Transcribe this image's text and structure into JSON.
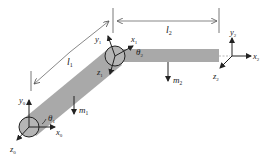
{
  "diagram": {
    "title": "",
    "colors": {
      "link": "#a9a9a9",
      "joint_fill": "#b5b5b5",
      "stroke": "#222222",
      "dimension": "#555555"
    },
    "labels": {
      "l1": {
        "main": "l",
        "sub": "1"
      },
      "l2": {
        "main": "l",
        "sub": "2"
      },
      "m1": {
        "main": "m",
        "sub": "1"
      },
      "m2": {
        "main": "m",
        "sub": "2"
      },
      "theta1": {
        "main": "θ",
        "sub": "1"
      },
      "theta2": {
        "main": "θ",
        "sub": "2"
      },
      "x0": {
        "main": "x",
        "sub": "0"
      },
      "y0": {
        "main": "y",
        "sub": "0"
      },
      "z0": {
        "main": "z",
        "sub": "0"
      },
      "x1": {
        "main": "x",
        "sub": "1"
      },
      "y1": {
        "main": "y",
        "sub": "1"
      },
      "z1": {
        "main": "z",
        "sub": "1"
      },
      "x2": {
        "main": "x",
        "sub": "2"
      },
      "y2": {
        "main": "y",
        "sub": "2"
      },
      "z2": {
        "main": "z",
        "sub": "2"
      }
    }
  }
}
